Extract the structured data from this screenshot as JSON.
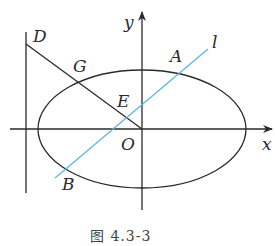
{
  "diagram": {
    "caption": "图 4.3-3",
    "axes": {
      "x_label": "x",
      "y_label": "y"
    },
    "points": {
      "D": "D",
      "G": "G",
      "A": "A",
      "E": "E",
      "O": "O",
      "B": "B"
    },
    "line_label": "l",
    "colors": {
      "stroke": "#2a2a2a",
      "line_l": "#5bb8e0"
    }
  }
}
